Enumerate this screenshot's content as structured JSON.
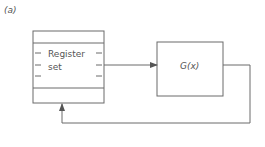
{
  "figure_label": "(a)",
  "register_box": {
    "line1": "Register",
    "line2": "set"
  },
  "function_box": {
    "label": "G(x)"
  },
  "connections": [
    {
      "from": "register-set",
      "to": "function-g",
      "direction": "forward"
    },
    {
      "from": "function-g",
      "to": "register-set",
      "direction": "feedback"
    }
  ]
}
